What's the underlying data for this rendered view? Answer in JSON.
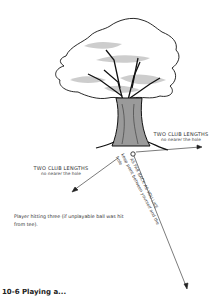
{
  "figure": {
    "labels": {
      "right": {
        "caption": "TWO CLUB LENGTHS",
        "sub": "no nearer the hole"
      },
      "left": {
        "caption": "TWO CLUB LENGTHS",
        "sub": "no nearer the hole"
      },
      "back": {
        "caption": "AS FAR BACK AS YOU LIKE",
        "sub": "keep point between yourself and the hole"
      }
    },
    "note": "Player hitting three (if unplayable ball was hit from tee).",
    "caption": "10-6  Playing a..."
  }
}
